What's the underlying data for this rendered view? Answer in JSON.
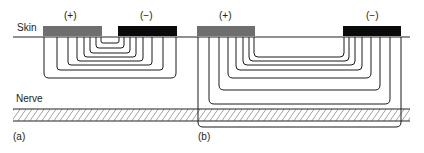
{
  "labels": {
    "skin": "Skin",
    "nerve": "Nerve",
    "panel_a": "(a)",
    "panel_b": "(b)",
    "anode_a": "(+)",
    "cathode_a": "(−)",
    "anode_b": "(+)",
    "cathode_b": "(−)"
  },
  "colors": {
    "anode": "#6e6e6e",
    "cathode": "#0a0a0a",
    "line": "#1a1a1a"
  },
  "panel_a": {
    "description": "Closely spaced electrodes: current field lines stay shallow and do not reach the nerve",
    "field_line_count": 8
  },
  "panel_b": {
    "description": "Widely spaced electrodes: deeper current field lines reach the nerve",
    "field_line_count": 8
  }
}
